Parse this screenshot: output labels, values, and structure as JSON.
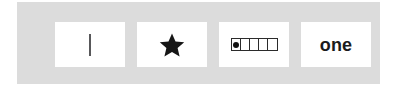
{
  "panel": {
    "background_color": "#dcdcdc",
    "page_background_color": "#ffffff"
  },
  "representations": {
    "title": "one",
    "cards": [
      {
        "id": "tally",
        "icon": "tally-stroke-icon",
        "label": "",
        "count": 1,
        "description": "single vertical tally stroke",
        "color": "#58585a"
      },
      {
        "id": "star",
        "icon": "star-icon",
        "label": "",
        "count": 1,
        "description": "one solid five-pointed star",
        "color": "#161616"
      },
      {
        "id": "five-frame",
        "icon": "five-frame-icon",
        "label": "",
        "count": 1,
        "cells": 5,
        "filled_cells": 1,
        "description": "five-frame strip with one filled dot",
        "color": "#111111"
      },
      {
        "id": "word",
        "icon": "",
        "label": "one",
        "count": 1,
        "description": "number word",
        "color": "#1b1b1b"
      }
    ]
  }
}
